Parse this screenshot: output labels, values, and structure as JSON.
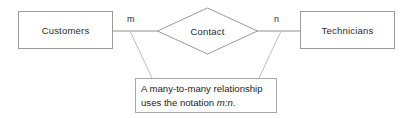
{
  "diagram": {
    "type": "entity-relationship-diagram",
    "background_color": "#ffffff",
    "line_color": "#9a9a9a",
    "text_color": "#2b2b2b",
    "entities": [
      {
        "id": "customers",
        "label": "Customers"
      },
      {
        "id": "technicians",
        "label": "Technicians"
      }
    ],
    "relationship": {
      "id": "contact",
      "label": "Contact",
      "shape": "diamond"
    },
    "cardinalities": {
      "left": "m",
      "right": "n"
    },
    "callout": {
      "line1": "A many-to-many relationship",
      "line2_prefix": "uses the notation ",
      "line2_italic": "m:n",
      "line2_suffix": ".",
      "border_color": "#a8a8a8"
    }
  }
}
